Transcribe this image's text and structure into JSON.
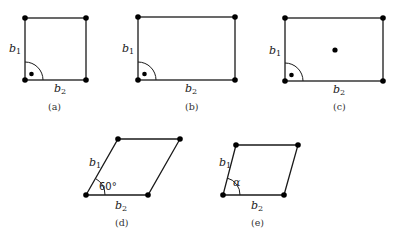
{
  "figures": [
    {
      "id": "a",
      "caption": "(a)",
      "shape": "square",
      "side_labels": {
        "vertical": "b",
        "vertical_sub": "1",
        "horizontal": "b",
        "horizontal_sub": "2"
      },
      "right_angle_marker": true,
      "centered_point": false
    },
    {
      "id": "b",
      "caption": "(b)",
      "shape": "rectangle",
      "side_labels": {
        "vertical": "b",
        "vertical_sub": "1",
        "horizontal": "b",
        "horizontal_sub": "2"
      },
      "right_angle_marker": true,
      "centered_point": false
    },
    {
      "id": "c",
      "caption": "(c)",
      "shape": "centered rectangle",
      "side_labels": {
        "vertical": "b",
        "vertical_sub": "1",
        "horizontal": "b",
        "horizontal_sub": "2"
      },
      "right_angle_marker": true,
      "centered_point": true
    },
    {
      "id": "d",
      "caption": "(d)",
      "shape": "rhombic (60 degree)",
      "side_labels": {
        "vertical": "b",
        "vertical_sub": "1",
        "horizontal": "b",
        "horizontal_sub": "2"
      },
      "angle_label": "60°"
    },
    {
      "id": "e",
      "caption": "(e)",
      "shape": "oblique parallelogram",
      "side_labels": {
        "vertical": "b",
        "vertical_sub": "1",
        "horizontal": "b",
        "horizontal_sub": "2"
      },
      "angle_label": "α"
    }
  ],
  "colors": {
    "line": "#1a1a1a",
    "point": "#000000",
    "background": "#ffffff"
  }
}
